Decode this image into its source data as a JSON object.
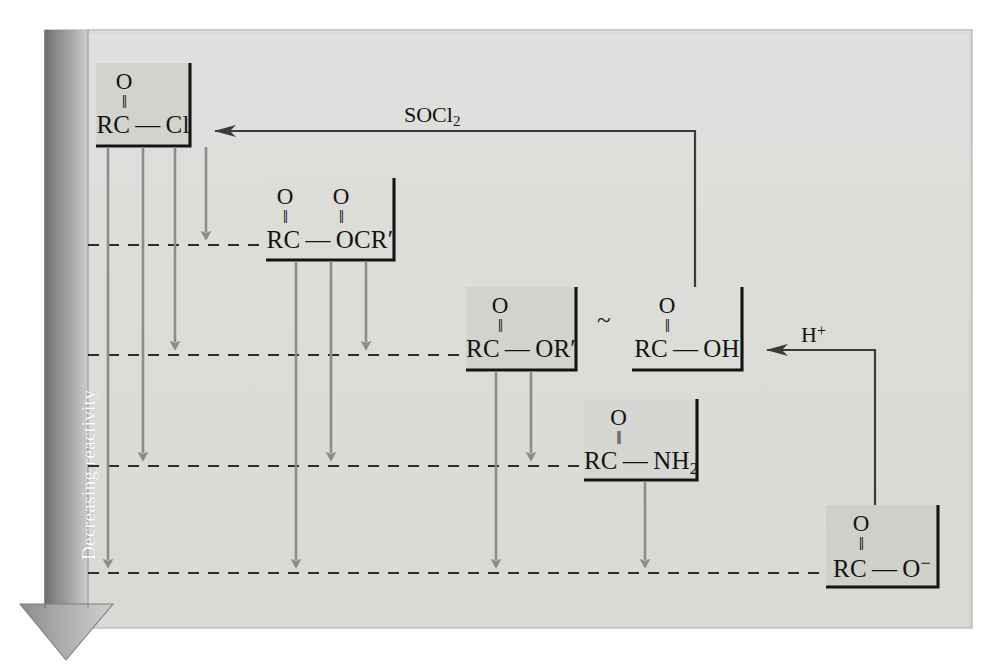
{
  "figure": {
    "kind": "reactivity-ladder-diagram",
    "axis": {
      "label": "Decreasing reactivity",
      "direction": "downward"
    },
    "background_color": "#e2e2e0",
    "panel_color": "#dcdcda",
    "box_fill_color": "#d3d3d0",
    "arrow_gray": "#8c8c8c",
    "ink_color": "#15130f",
    "species": [
      {
        "id": "acid-chloride",
        "name": "acyl chloride",
        "top_atom": "O",
        "bond": "‖",
        "formula_left": "RC",
        "dash": "—",
        "formula_right": "Cl",
        "shaded": true
      },
      {
        "id": "anhydride",
        "name": "acid anhydride",
        "top_atom": "O",
        "top_atom_2": "O",
        "bond": "‖",
        "formula_left": "RC",
        "dash": "—",
        "formula_right": "OCR′",
        "shaded": false
      },
      {
        "id": "ester",
        "name": "ester",
        "top_atom": "O",
        "bond": "‖",
        "formula_left": "RC",
        "dash": "—",
        "formula_right": "OR′",
        "shaded": true
      },
      {
        "id": "carboxylic-acid",
        "name": "carboxylic acid",
        "top_atom": "O",
        "bond": "‖",
        "formula_left": "RC",
        "dash": "—",
        "formula_right": "OH",
        "shaded": false
      },
      {
        "id": "amide",
        "name": "amide",
        "top_atom": "O",
        "bond": "‖",
        "formula_left": "RC",
        "dash": "—",
        "formula_right": "NH2",
        "formula_right_base": "NH",
        "formula_right_sub": "2",
        "shaded": true
      },
      {
        "id": "carboxylate",
        "name": "carboxylate ion",
        "top_atom": "O",
        "bond": "‖",
        "formula_left": "RC",
        "dash": "—",
        "formula_right_base": "O",
        "formula_right_sup": "−",
        "shaded": true
      }
    ],
    "equivalence_symbol": "~",
    "reagents": [
      {
        "id": "thionyl-chloride",
        "base": "SOCl",
        "sub": "2",
        "sup": "",
        "from": "carboxylic-acid",
        "to": "acid-chloride"
      },
      {
        "id": "proton",
        "base": "H",
        "sub": "",
        "sup": "+",
        "from": "carboxylate",
        "to": "carboxylic-acid"
      }
    ],
    "reactivity_levels": [
      {
        "index": 0,
        "species": "acid-chloride",
        "y": 131
      },
      {
        "index": 1,
        "species": "anhydride",
        "y": 245
      },
      {
        "index": 2,
        "species": "ester",
        "y": 355
      },
      {
        "index": 3,
        "species": "amide",
        "y": 466
      },
      {
        "index": 4,
        "species": "carboxylate",
        "y": 573
      }
    ]
  }
}
